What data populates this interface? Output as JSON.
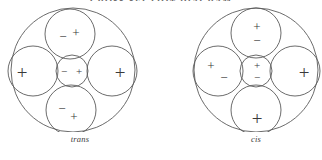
{
  "figure": {
    "clipped_header_text": "CROSS-SECTION DIAGRAM",
    "stroke_color": "#5a5a5a",
    "text_color": "#3a3a3a",
    "background_color": "#ffffff"
  },
  "diagrams": [
    {
      "id": "trans",
      "caption": "trans",
      "outer": {
        "cx": 73,
        "cy": 70,
        "r": 62
      },
      "lobes": [
        {
          "name": "top-lobe",
          "cx": 70,
          "cy": 34,
          "r": 25,
          "signs": [
            {
              "glyph": "−",
              "x": 63,
              "y": 36,
              "size": "sign-md"
            },
            {
              "glyph": "+",
              "x": 76,
              "y": 32,
              "size": "sign-md"
            }
          ]
        },
        {
          "name": "left-lobe",
          "cx": 33,
          "cy": 71,
          "r": 25,
          "signs": [
            {
              "glyph": "+",
              "x": 22,
              "y": 72,
              "size": "sign-lg"
            }
          ]
        },
        {
          "name": "right-lobe",
          "cx": 112,
          "cy": 71,
          "r": 25,
          "signs": [
            {
              "glyph": "+",
              "x": 120,
              "y": 72,
              "size": "sign-lg"
            }
          ]
        },
        {
          "name": "bottom-lobe",
          "cx": 71,
          "cy": 110,
          "r": 25,
          "signs": [
            {
              "glyph": "−",
              "x": 62,
              "y": 108,
              "size": "sign-md"
            },
            {
              "glyph": "+",
              "x": 74,
              "y": 116,
              "size": "sign-md"
            }
          ]
        },
        {
          "name": "core-lobe",
          "cx": 72,
          "cy": 71,
          "r": 16,
          "signs": [
            {
              "glyph": "−",
              "x": 64,
              "y": 71,
              "size": "sign-sm"
            },
            {
              "glyph": "+",
              "x": 79,
              "y": 71,
              "size": "sign-sm"
            }
          ]
        }
      ]
    },
    {
      "id": "cis",
      "caption": "cis",
      "outer": {
        "cx": 66,
        "cy": 70,
        "r": 62
      },
      "lobes": [
        {
          "name": "top-lobe",
          "cx": 66,
          "cy": 33,
          "r": 25,
          "signs": [
            {
              "glyph": "+",
              "x": 67,
              "y": 26,
              "size": "sign-md"
            },
            {
              "glyph": "−",
              "x": 67,
              "y": 40,
              "size": "sign-md"
            }
          ]
        },
        {
          "name": "left-lobe",
          "cx": 28,
          "cy": 71,
          "r": 25,
          "signs": [
            {
              "glyph": "+",
              "x": 21,
              "y": 65,
              "size": "sign-md"
            },
            {
              "glyph": "−",
              "x": 34,
              "y": 77,
              "size": "sign-md"
            }
          ]
        },
        {
          "name": "right-lobe",
          "cx": 105,
          "cy": 71,
          "r": 25,
          "signs": [
            {
              "glyph": "+",
              "x": 114,
              "y": 72,
              "size": "sign-lg"
            }
          ]
        },
        {
          "name": "bottom-lobe",
          "cx": 66,
          "cy": 110,
          "r": 25,
          "signs": [
            {
              "glyph": "+",
              "x": 67,
              "y": 118,
              "size": "sign-lg"
            }
          ]
        },
        {
          "name": "core-lobe",
          "cx": 66,
          "cy": 71,
          "r": 16,
          "signs": [
            {
              "glyph": "+",
              "x": 67,
              "y": 65,
              "size": "sign-sm"
            },
            {
              "glyph": "−",
              "x": 67,
              "y": 77,
              "size": "sign-sm"
            }
          ]
        }
      ]
    }
  ]
}
